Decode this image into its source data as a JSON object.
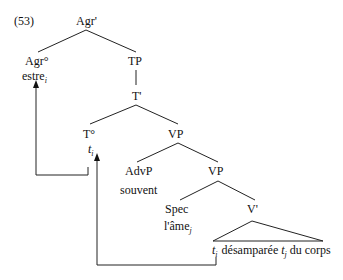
{
  "example_number": "(53)",
  "nodes": {
    "agr_bar": "Agr'",
    "agr_head": "Agr°",
    "agr_head_word": "estre",
    "agr_head_index": "i",
    "tp": "TP",
    "t_bar": "T'",
    "t_head": "T°",
    "t_head_trace": "t",
    "t_head_trace_index": "i",
    "vp1": "VP",
    "advp": "AdvP",
    "advp_word": "souvent",
    "vp2": "VP",
    "spec": "Spec",
    "spec_word": "l'âme",
    "spec_index": "j",
    "v_bar": "V'",
    "v_trace": "t",
    "v_trace_index": "i",
    "v_word": "désamparée",
    "obj_trace": "t",
    "obj_trace_index": "j",
    "pp": "du corps"
  }
}
